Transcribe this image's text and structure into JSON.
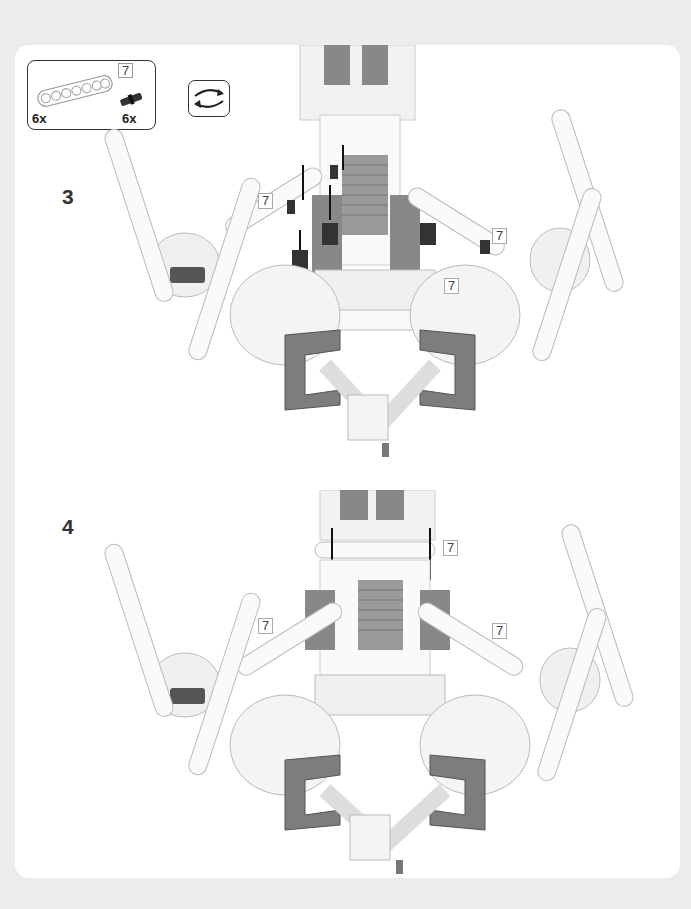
{
  "parts_list": {
    "items": [
      {
        "name": "7-module beam",
        "quantity": "6x",
        "length_badge": "7"
      },
      {
        "name": "connector peg",
        "quantity": "6x"
      }
    ]
  },
  "rotate_icon": "rotate-model-icon",
  "steps": [
    {
      "number": "3",
      "callouts": [
        "7",
        "7",
        "7"
      ]
    },
    {
      "number": "4",
      "callouts": [
        "7",
        "7",
        "7"
      ]
    }
  ],
  "colors": {
    "page_background": "#ececec",
    "page": "#ffffff",
    "dark_gray": "#555555",
    "medium_gray": "#8a8a8a",
    "light_gray": "#d8d8d8"
  }
}
